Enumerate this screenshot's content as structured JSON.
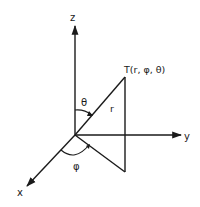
{
  "diagram": {
    "axes": {
      "z_label": "z",
      "y_label": "y",
      "x_label": "x"
    },
    "point_label": "T(r, φ, θ)",
    "radius_label": "r",
    "polar_angle_label": "θ",
    "azimuth_angle_label": "φ",
    "colors": {
      "stroke": "#1a1a1a",
      "background": "#ffffff"
    }
  }
}
